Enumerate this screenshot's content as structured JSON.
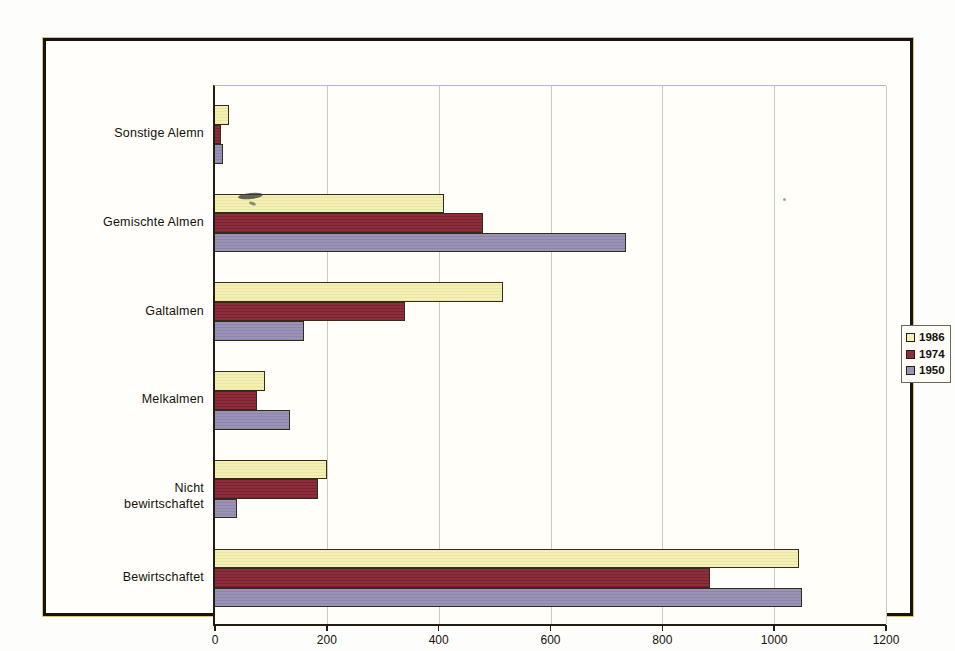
{
  "figure": {
    "background_color": "#fdfdfb",
    "frame_border_color": "#17130d",
    "plot_background_color": "#fffef9",
    "gridline_color": "#ccc9bd",
    "axis_color": "#221d14"
  },
  "chart_data": {
    "type": "bar",
    "orientation": "horizontal",
    "title": "",
    "xlabel": "",
    "ylabel": "",
    "categories": [
      "Sonstige Alemn",
      "Gemischte Almen",
      "Galtalmen",
      "Melkalmen",
      "Nicht bewirtschaftet",
      "Bewirtschaftet"
    ],
    "series": [
      {
        "name": "1986",
        "fill": "#f3efb5",
        "stripe": "#eae5a0",
        "values": [
          25,
          410,
          515,
          90,
          200,
          1045
        ]
      },
      {
        "name": "1974",
        "fill": "#8e2d3c",
        "stripe": "#7a2130",
        "values": [
          10,
          480,
          340,
          75,
          185,
          885
        ]
      },
      {
        "name": "1950",
        "fill": "#9a93b6",
        "stripe": "#8d86aa",
        "values": [
          15,
          735,
          160,
          135,
          40,
          1050
        ]
      }
    ],
    "xlim": [
      0,
      1200
    ],
    "xticks": [
      "0",
      "200",
      "400",
      "600",
      "800",
      "1000",
      "1200"
    ],
    "grid": true,
    "legend_position": "right",
    "legend_entries": [
      "1986",
      "1974",
      "1950"
    ]
  }
}
